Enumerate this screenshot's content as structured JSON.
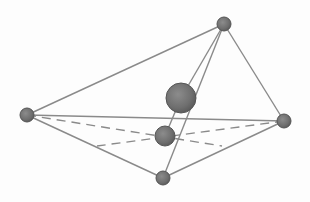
{
  "diagram": {
    "type": "geometric-figure",
    "colors": {
      "background": "#fdfdfd",
      "edge": "#8a8a8a",
      "node_fill": "#6e6e6e",
      "node_stroke": "#555555",
      "node_highlight": "#8c8c8c"
    },
    "nodes": [
      {
        "id": "top",
        "x": 224,
        "y": 24,
        "r": 7
      },
      {
        "id": "left",
        "x": 27,
        "y": 115,
        "r": 7
      },
      {
        "id": "right",
        "x": 284,
        "y": 121,
        "r": 7
      },
      {
        "id": "bottom",
        "x": 163,
        "y": 178,
        "r": 7
      },
      {
        "id": "center-large",
        "x": 181,
        "y": 98,
        "r": 15
      },
      {
        "id": "center-lower",
        "x": 165,
        "y": 136,
        "r": 10
      }
    ],
    "solid_edges": [
      {
        "from": "left",
        "to": "top"
      },
      {
        "from": "top",
        "to": "right"
      },
      {
        "from": "left",
        "to": "right"
      },
      {
        "from": "left",
        "to": "bottom"
      },
      {
        "from": "right",
        "to": "bottom"
      },
      {
        "from": "top",
        "to": "bottom"
      },
      {
        "from": "top",
        "to": "center-large"
      },
      {
        "from": "center-large",
        "to": "center-lower"
      }
    ],
    "dashed_edges": [
      {
        "x1": 27,
        "y1": 115,
        "x2": 222,
        "y2": 146
      },
      {
        "x1": 284,
        "y1": 121,
        "x2": 97,
        "y2": 146
      }
    ]
  }
}
